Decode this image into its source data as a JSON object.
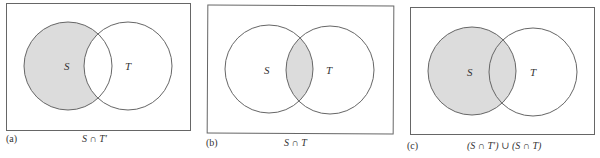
{
  "colors": {
    "background": "#ffffff",
    "stroke": "#666666",
    "shade": "#dcdcdc",
    "text": "#333333"
  },
  "panels": [
    {
      "id": "a",
      "label": "(a)",
      "caption": "S ∩ T′",
      "shaded_region": "S minus T",
      "set_labels": {
        "s": "S",
        "t": "T"
      }
    },
    {
      "id": "b",
      "label": "(b)",
      "caption": "S ∩ T",
      "shaded_region": "intersection of S and T",
      "set_labels": {
        "s": "S",
        "t": "T"
      }
    },
    {
      "id": "c",
      "label": "(c)",
      "caption": "(S ∩ T′) ∪ (S ∩ T)",
      "shaded_region": "all of S",
      "set_labels": {
        "s": "S",
        "t": "T"
      }
    }
  ]
}
